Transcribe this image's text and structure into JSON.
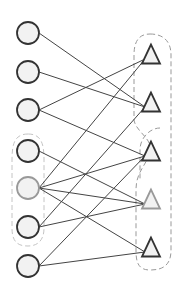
{
  "diagram": {
    "type": "bipartite-graph",
    "left_nodes": [
      {
        "id": "c1",
        "shape": "circle",
        "cx": 28,
        "cy": 33,
        "stroke": "#333333"
      },
      {
        "id": "c2",
        "shape": "circle",
        "cx": 28,
        "cy": 72,
        "stroke": "#333333"
      },
      {
        "id": "c3",
        "shape": "circle",
        "cx": 28,
        "cy": 110,
        "stroke": "#333333"
      },
      {
        "id": "c4",
        "shape": "circle",
        "cx": 28,
        "cy": 151,
        "stroke": "#333333"
      },
      {
        "id": "c5",
        "shape": "circle",
        "cx": 28,
        "cy": 188,
        "stroke": "#999999"
      },
      {
        "id": "c6",
        "shape": "circle",
        "cx": 28,
        "cy": 227,
        "stroke": "#333333"
      },
      {
        "id": "c7",
        "shape": "circle",
        "cx": 28,
        "cy": 266,
        "stroke": "#333333"
      }
    ],
    "right_nodes": [
      {
        "id": "t1",
        "shape": "triangle",
        "cx": 151,
        "cy": 55,
        "stroke": "#333333"
      },
      {
        "id": "t2",
        "shape": "triangle",
        "cx": 151,
        "cy": 103,
        "stroke": "#333333"
      },
      {
        "id": "t3",
        "shape": "triangle",
        "cx": 151,
        "cy": 152,
        "stroke": "#333333"
      },
      {
        "id": "t4",
        "shape": "triangle",
        "cx": 151,
        "cy": 200,
        "stroke": "#999999"
      },
      {
        "id": "t5",
        "shape": "triangle",
        "cx": 151,
        "cy": 248,
        "stroke": "#333333"
      }
    ],
    "edges": [
      [
        "c1",
        "t2"
      ],
      [
        "c2",
        "t2"
      ],
      [
        "c3",
        "t1"
      ],
      [
        "c3",
        "t3"
      ],
      [
        "c4",
        "t4"
      ],
      [
        "c5",
        "t1"
      ],
      [
        "c5",
        "t3"
      ],
      [
        "c5",
        "t4"
      ],
      [
        "c5",
        "t5"
      ],
      [
        "c6",
        "t2"
      ],
      [
        "c6",
        "t4"
      ],
      [
        "c7",
        "t3"
      ],
      [
        "c7",
        "t5"
      ]
    ],
    "groups": [
      {
        "id": "left-group",
        "members": [
          "c4",
          "c5",
          "c6"
        ],
        "style": "dashed",
        "color": "#bbbbbb"
      },
      {
        "id": "right-group-outer",
        "members": [
          "t1",
          "t2",
          "t3",
          "t4",
          "t5"
        ],
        "style": "dashed",
        "color": "#999999"
      },
      {
        "id": "right-group-inner",
        "members": [
          "t1",
          "t2"
        ],
        "style": "dashed",
        "color": "#999999"
      }
    ],
    "colors": {
      "node_fill": "#f2f2f2",
      "edge": "#444444",
      "node_stroke": "#333333",
      "highlight_stroke": "#999999"
    }
  }
}
